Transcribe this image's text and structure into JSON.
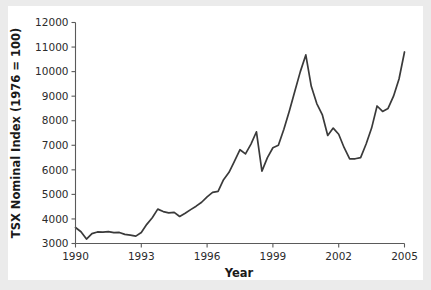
{
  "figure": {
    "background_color": "#ffffff",
    "page_background_color": "#ebebeb",
    "line_color": "#3a3a3a",
    "axis_color": "#5a5a5a"
  },
  "chart_data": {
    "type": "line",
    "title": "",
    "xlabel": "Year",
    "ylabel": "TSX Nominal Index (1976 = 100)",
    "xlim": [
      1990,
      2005
    ],
    "ylim": [
      3000,
      12000
    ],
    "grid": false,
    "legend": "none",
    "xticks": [
      "1990",
      "1993",
      "1996",
      "1999",
      "2002",
      "2005"
    ],
    "xtick_values": [
      1990,
      1993,
      1996,
      1999,
      2002,
      2005
    ],
    "yticks": [
      "3000",
      "4000",
      "5000",
      "6000",
      "7000",
      "8000",
      "9000",
      "10000",
      "11000",
      "12000"
    ],
    "ytick_values": [
      3000,
      4000,
      5000,
      6000,
      7000,
      8000,
      9000,
      10000,
      11000,
      12000
    ],
    "series": [
      {
        "name": "TSX Nominal Index",
        "x": [
          1990.0,
          1990.25,
          1990.5,
          1990.75,
          1991.0,
          1991.25,
          1991.5,
          1991.75,
          1992.0,
          1992.25,
          1992.5,
          1992.75,
          1993.0,
          1993.25,
          1993.5,
          1993.75,
          1994.0,
          1994.25,
          1994.5,
          1994.75,
          1995.0,
          1995.25,
          1995.5,
          1995.75,
          1996.0,
          1996.25,
          1996.5,
          1996.75,
          1997.0,
          1997.25,
          1997.5,
          1997.75,
          1998.0,
          1998.25,
          1998.5,
          1998.75,
          1999.0,
          1999.25,
          1999.5,
          1999.75,
          2000.0,
          2000.25,
          2000.5,
          2000.75,
          2001.0,
          2001.25,
          2001.5,
          2001.75,
          2002.0,
          2002.25,
          2002.5,
          2002.75,
          2003.0,
          2003.25,
          2003.5,
          2003.75,
          2004.0,
          2004.25,
          2004.5,
          2004.75,
          2005.0
        ],
        "values": [
          3650,
          3480,
          3180,
          3400,
          3470,
          3460,
          3480,
          3440,
          3450,
          3370,
          3340,
          3300,
          3450,
          3780,
          4050,
          4400,
          4300,
          4250,
          4270,
          4100,
          4230,
          4380,
          4520,
          4680,
          4900,
          5080,
          5120,
          5600,
          5900,
          6350,
          6820,
          6650,
          7050,
          7550,
          5950,
          6500,
          6900,
          7000,
          7650,
          8400,
          9200,
          10000,
          10680,
          9400,
          8700,
          8250,
          7400,
          7700,
          7450,
          6900,
          6450,
          6450,
          6500,
          7050,
          7700,
          8600,
          8380,
          8500,
          9000,
          9700,
          10800
        ]
      }
    ]
  }
}
